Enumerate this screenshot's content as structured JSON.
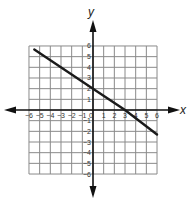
{
  "chart_data": {
    "type": "line",
    "title": "",
    "xlabel": "x",
    "ylabel": "y",
    "xlim": [
      -6,
      6
    ],
    "ylim": [
      -6,
      6
    ],
    "grid": true,
    "x_ticks": [
      -6,
      -5,
      -4,
      -3,
      -2,
      -1,
      0,
      1,
      2,
      3,
      4,
      5,
      6
    ],
    "y_ticks": [
      6,
      5,
      4,
      3,
      2,
      1,
      -1,
      -2,
      -3,
      -4,
      -5,
      -6
    ],
    "series": [
      {
        "name": "line",
        "points": [
          [
            -5.5,
            5.67
          ],
          [
            0,
            2
          ],
          [
            3,
            0
          ],
          [
            6,
            -2.3
          ]
        ],
        "slope": -0.6667,
        "y_intercept": 2,
        "x_intercept": 3,
        "color": "#1a1a1a"
      }
    ]
  },
  "labels": {
    "x_axis": "x",
    "y_axis": "y",
    "origin": "0"
  }
}
